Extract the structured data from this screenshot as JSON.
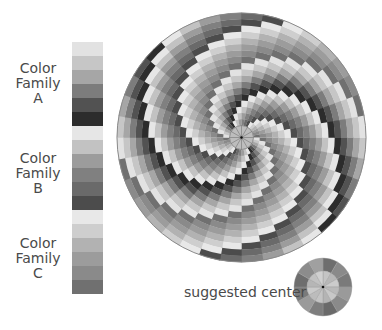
{
  "families": [
    {
      "label_lines": [
        "Color",
        "Family",
        "A"
      ],
      "top": 61,
      "colors": [
        "#e2e2e2",
        "#c6c6c6",
        "#a6a6a6",
        "#7c7c7c",
        "#525252",
        "#2c2c2c"
      ]
    },
    {
      "label_lines": [
        "Color",
        "Family",
        "B"
      ],
      "top": 151,
      "colors": [
        "#e6e6e6",
        "#c2c2c2",
        "#9c9c9c",
        "#808080",
        "#6a6a6a",
        "#4c4c4c"
      ]
    },
    {
      "label_lines": [
        "Color",
        "Family",
        "C"
      ],
      "top": 236,
      "colors": [
        "#e8e8e8",
        "#cecece",
        "#b2b2b2",
        "#9c9c9c",
        "#8a8a8a",
        "#707070"
      ]
    }
  ],
  "spiral": {
    "cx": 241.5,
    "cy": 137.5,
    "outer_radius": 124.5,
    "inner_radius": 12,
    "rings": 18,
    "sectors": 36,
    "arms": 2,
    "hub_spokes": 12
  },
  "suggested_center": {
    "text": "suggested center",
    "cx": 323,
    "cy": 287,
    "outer_radius": 29,
    "inner_radius": 16,
    "sectors": 12,
    "outer_colors": [
      "#6e6e6e",
      "#8a8a8a",
      "#7a7a7a",
      "#9a9a9a",
      "#8a8a8a",
      "#6a6a6a",
      "#7e7e7e",
      "#9a9a9a",
      "#7a7a7a",
      "#6e6e6e",
      "#8c8c8c",
      "#a0a0a0"
    ],
    "inner_colors": [
      "#c4c4c4",
      "#b8b8b8",
      "#cccccc",
      "#bababa",
      "#c8c8c8",
      "#b4b4b4",
      "#c4c4c4",
      "#bcbcbc",
      "#cacaca",
      "#b6b6b6",
      "#c2c2c2",
      "#d0d0d0"
    ]
  }
}
